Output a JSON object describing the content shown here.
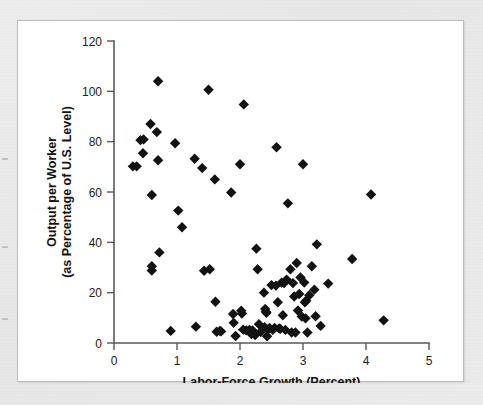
{
  "figure": {
    "background_color": "#ffffff",
    "page_color": "#e8e8e8",
    "border_color": "#bdbdbd",
    "marker_color": "#121212",
    "axis_color": "#555a5e"
  },
  "chart_data": {
    "type": "scatter",
    "title": "",
    "subtitle": "",
    "xlabel": "Labor-Force Growth (Percent)",
    "ylabel": "Output per Worker\n(as Percentage of U.S. Level)",
    "ylabel_line1": "Output per Worker",
    "ylabel_line2": "(as Percentage of U.S. Level)",
    "xlim": [
      0,
      5
    ],
    "ylim": [
      0,
      120
    ],
    "xticks": [
      0,
      1,
      2,
      3,
      4,
      5
    ],
    "yticks": [
      0,
      20,
      40,
      60,
      80,
      100,
      120
    ],
    "xticklabels": [
      "0",
      "1",
      "2",
      "3",
      "4",
      "5"
    ],
    "yticklabels": [
      "0",
      "20",
      "40",
      "60",
      "80",
      "100",
      "120"
    ],
    "grid": false,
    "legend": null,
    "legend_position": "none",
    "marker_shape": "diamond",
    "marker_size": 5.2,
    "series": [
      {
        "name": "Countries",
        "points": [
          [
            0.3,
            70.2
          ],
          [
            0.36,
            70.2
          ],
          [
            0.42,
            80.6
          ],
          [
            0.47,
            80.9
          ],
          [
            0.46,
            75.4
          ],
          [
            0.58,
            87.0
          ],
          [
            0.6,
            58.8
          ],
          [
            0.6,
            30.5
          ],
          [
            0.6,
            28.8
          ],
          [
            0.68,
            83.8
          ],
          [
            0.7,
            104.0
          ],
          [
            0.7,
            72.6
          ],
          [
            0.72,
            36.0
          ],
          [
            0.9,
            4.8
          ],
          [
            0.97,
            79.4
          ],
          [
            1.02,
            52.6
          ],
          [
            1.08,
            46.0
          ],
          [
            1.28,
            73.2
          ],
          [
            1.3,
            6.5
          ],
          [
            1.4,
            69.5
          ],
          [
            1.43,
            28.7
          ],
          [
            1.5,
            100.6
          ],
          [
            1.52,
            29.3
          ],
          [
            1.6,
            65.0
          ],
          [
            1.61,
            16.4
          ],
          [
            1.63,
            4.5
          ],
          [
            1.68,
            4.8
          ],
          [
            1.7,
            4.6
          ],
          [
            1.86,
            59.8
          ],
          [
            1.89,
            11.5
          ],
          [
            1.9,
            8.0
          ],
          [
            1.93,
            2.8
          ],
          [
            2.0,
            71.0
          ],
          [
            2.02,
            12.8
          ],
          [
            2.03,
            11.7
          ],
          [
            2.05,
            5.3
          ],
          [
            2.06,
            94.8
          ],
          [
            2.1,
            5.0
          ],
          [
            2.15,
            5.2
          ],
          [
            2.18,
            3.6
          ],
          [
            2.2,
            5.0
          ],
          [
            2.24,
            3.2
          ],
          [
            2.26,
            37.5
          ],
          [
            2.28,
            29.3
          ],
          [
            2.3,
            7.5
          ],
          [
            2.33,
            4.4
          ],
          [
            2.36,
            5.2
          ],
          [
            2.38,
            20.0
          ],
          [
            2.39,
            6.3
          ],
          [
            2.4,
            13.5
          ],
          [
            2.41,
            12.4
          ],
          [
            2.42,
            12.0
          ],
          [
            2.43,
            2.7
          ],
          [
            2.45,
            5.6
          ],
          [
            2.47,
            6.0
          ],
          [
            2.5,
            23.0
          ],
          [
            2.52,
            5.2
          ],
          [
            2.55,
            6.0
          ],
          [
            2.57,
            22.8
          ],
          [
            2.58,
            77.8
          ],
          [
            2.6,
            16.2
          ],
          [
            2.62,
            5.8
          ],
          [
            2.64,
            5.6
          ],
          [
            2.66,
            24.0
          ],
          [
            2.68,
            11.0
          ],
          [
            2.7,
            23.8
          ],
          [
            2.72,
            5.2
          ],
          [
            2.74,
            25.2
          ],
          [
            2.76,
            55.5
          ],
          [
            2.8,
            29.3
          ],
          [
            2.82,
            4.2
          ],
          [
            2.84,
            23.8
          ],
          [
            2.86,
            18.5
          ],
          [
            2.88,
            4.2
          ],
          [
            2.9,
            31.8
          ],
          [
            2.92,
            12.9
          ],
          [
            2.94,
            19.5
          ],
          [
            2.96,
            26.0
          ],
          [
            2.98,
            10.5
          ],
          [
            3.0,
            71.0
          ],
          [
            3.02,
            24.0
          ],
          [
            3.03,
            16.2
          ],
          [
            3.04,
            9.8
          ],
          [
            3.05,
            16.8
          ],
          [
            3.07,
            4.2
          ],
          [
            3.1,
            19.0
          ],
          [
            3.14,
            30.5
          ],
          [
            3.18,
            21.2
          ],
          [
            3.2,
            10.6
          ],
          [
            3.22,
            39.2
          ],
          [
            3.28,
            6.8
          ],
          [
            3.4,
            23.6
          ],
          [
            3.78,
            33.4
          ],
          [
            4.08,
            59.0
          ],
          [
            4.28,
            9.0
          ]
        ]
      }
    ],
    "n_points": 96,
    "x_data_range": [
      0.3,
      4.28
    ],
    "y_data_range": [
      2.7,
      104.0
    ]
  },
  "edge_marks": [
    {
      "top": 8
    },
    {
      "top": 96
    },
    {
      "top": 168
    }
  ]
}
